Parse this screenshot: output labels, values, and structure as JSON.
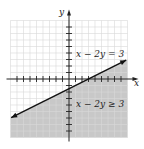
{
  "chart_data": {
    "type": "line",
    "title": "",
    "xlabel": "x",
    "ylabel": "y",
    "xlim": [
      -9,
      9
    ],
    "ylim": [
      -9,
      9
    ],
    "grid": true,
    "series": [
      {
        "name": "x − 2y = 3",
        "equation": "y = (x - 3)/2",
        "x": [
          -9,
          9
        ],
        "y": [
          -6,
          3
        ],
        "arrows": "both"
      }
    ],
    "shaded_region": {
      "inequality": "x − 2y ≥ 3",
      "side": "below"
    },
    "annotations": [
      {
        "text": "x − 2y = 3",
        "x": 2,
        "y": 4
      },
      {
        "text": "x − 2y ≥ 3",
        "x": 2,
        "y": -3
      }
    ]
  },
  "labels": {
    "x_axis": "x",
    "y_axis": "y",
    "line_eq": "x − 2y = 3",
    "ineq": "x − 2y ≥ 3"
  },
  "colors": {
    "shade": "#c8c8c8",
    "grid": "#d8d8d8",
    "line": "#111111"
  }
}
